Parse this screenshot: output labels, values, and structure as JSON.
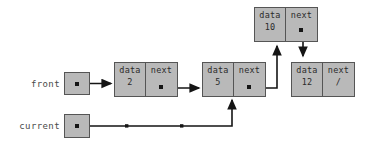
{
  "diagram": {
    "colors": {
      "background": "#ffffff",
      "box_fill": "#b9b9b9",
      "box_border": "#555555",
      "arrow": "#151515",
      "label_text": "#4a4a4a",
      "cell_text": "#2b2b2b"
    },
    "pointers": [
      {
        "name": "front",
        "label": "front",
        "target": "node-2"
      },
      {
        "name": "current",
        "label": "current",
        "target": "node-5"
      }
    ],
    "field_labels": {
      "data": "data",
      "next": "next"
    },
    "null_symbol": "/",
    "nodes": [
      {
        "id": "node-2",
        "data_label": "data",
        "data_value": "2",
        "next_label": "next",
        "next_value": "",
        "next_target": "node-5"
      },
      {
        "id": "node-5",
        "data_label": "data",
        "data_value": "5",
        "next_label": "next",
        "next_value": "",
        "next_target": "node-10"
      },
      {
        "id": "node-10",
        "data_label": "data",
        "data_value": "10",
        "next_label": "next",
        "next_value": "",
        "next_target": "node-12"
      },
      {
        "id": "node-12",
        "data_label": "data",
        "data_value": "12",
        "next_label": "next",
        "next_value": "/",
        "next_target": null
      }
    ]
  }
}
